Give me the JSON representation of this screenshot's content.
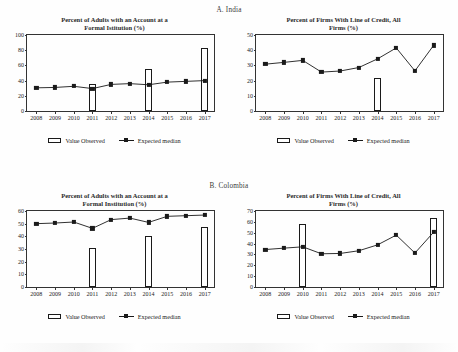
{
  "figure": {
    "panels": [
      {
        "header": "A. India",
        "charts": [
          {
            "title_line1": "Percent of Adults with an Account at a",
            "title_line2": "Formal Istitution (%)",
            "chart_data": {
              "type": "bar",
              "title": "Percent of Adults with an Account at a Formal Istitution (%)",
              "xlabel": "",
              "ylabel": "",
              "ylim": [
                0,
                100
              ],
              "yticks": [
                0,
                20,
                40,
                60,
                80,
                100
              ],
              "grid": false,
              "legend_position": "bottom",
              "categories": [
                "2008",
                "2009",
                "2010",
                "2011",
                "2012",
                "2013",
                "2014",
                "2015",
                "2016",
                "2017"
              ],
              "series": [
                {
                  "name": "Value Observed",
                  "type": "bar",
                  "values": [
                    null,
                    null,
                    null,
                    35.0,
                    null,
                    null,
                    55.0,
                    null,
                    null,
                    82.5
                  ]
                },
                {
                  "name": "Expected median",
                  "type": "line",
                  "values": [
                    30.5,
                    31.0,
                    32.5,
                    29.5,
                    35.0,
                    36.0,
                    34.5,
                    38.0,
                    39.0,
                    40.0
                  ]
                }
              ]
            },
            "legend": [
              {
                "label": "Value Observed",
                "marker": "open-rectangle-swatch"
              },
              {
                "label": "Expected median",
                "marker": "line-square-marker"
              }
            ]
          },
          {
            "title_line1": "Percent of Firms With Line of Credit, All",
            "title_line2": "Firms (%)",
            "chart_data": {
              "type": "bar",
              "title": "Percent of Firms With Line of Credit, All Firms (%)",
              "xlabel": "",
              "ylabel": "",
              "ylim": [
                0,
                50
              ],
              "yticks": [
                0,
                10,
                20,
                30,
                40,
                50
              ],
              "grid": false,
              "legend_position": "bottom",
              "categories": [
                "2008",
                "2009",
                "2010",
                "2011",
                "2012",
                "2013",
                "2014",
                "2015",
                "2016",
                "2017"
              ],
              "series": [
                {
                  "name": "Value Observed",
                  "type": "bar",
                  "values": [
                    null,
                    null,
                    null,
                    null,
                    null,
                    null,
                    21.8,
                    null,
                    null,
                    null
                  ]
                },
                {
                  "name": "Expected median",
                  "type": "line",
                  "values": [
                    30.8,
                    32.0,
                    33.3,
                    25.6,
                    26.3,
                    28.6,
                    34.3,
                    41.5,
                    26.4,
                    43.2
                  ]
                }
              ]
            },
            "legend": [
              {
                "label": "Value Observed",
                "marker": "open-rectangle-swatch"
              },
              {
                "label": "Expected median",
                "marker": "line-square-marker"
              }
            ]
          }
        ]
      },
      {
        "header": "B. Colombia",
        "charts": [
          {
            "title_line1": "Percent of Adults with an Account at a",
            "title_line2": "Formal Institution (%)",
            "chart_data": {
              "type": "bar",
              "title": "Percent of Adults with an Account at a Formal Institution (%)",
              "xlabel": "",
              "ylabel": "",
              "ylim": [
                0,
                60
              ],
              "yticks": [
                0,
                10,
                20,
                30,
                40,
                50,
                60
              ],
              "grid": false,
              "legend_position": "bottom",
              "categories": [
                "2008",
                "2009",
                "2010",
                "2011",
                "2012",
                "2013",
                "2014",
                "2015",
                "2016",
                "2017"
              ],
              "series": [
                {
                  "name": "Value Observed",
                  "type": "bar",
                  "values": [
                    null,
                    null,
                    null,
                    31.0,
                    null,
                    null,
                    40.2,
                    null,
                    null,
                    47.2
                  ]
                },
                {
                  "name": "Expected median",
                  "type": "line",
                  "values": [
                    50.0,
                    50.5,
                    51.3,
                    46.3,
                    53.2,
                    54.4,
                    51.0,
                    55.8,
                    56.3,
                    56.8
                  ]
                }
              ]
            },
            "legend": [
              {
                "label": "Value Observed",
                "marker": "open-rectangle-swatch"
              },
              {
                "label": "Expected median",
                "marker": "line-square-marker"
              }
            ]
          },
          {
            "title_line1": "Percent of Firms With Line of Credit, All",
            "title_line2": "Firms (%)",
            "chart_data": {
              "type": "bar",
              "title": "Percent of Firms With Line of Credit, All Firms (%)",
              "xlabel": "",
              "ylabel": "",
              "ylim": [
                0,
                70
              ],
              "yticks": [
                0,
                10,
                20,
                30,
                40,
                50,
                60,
                70
              ],
              "grid": false,
              "legend_position": "bottom",
              "categories": [
                "2008",
                "2009",
                "2010",
                "2011",
                "2012",
                "2013",
                "2014",
                "2015",
                "2016",
                "2017"
              ],
              "series": [
                {
                  "name": "Value Observed",
                  "type": "bar",
                  "values": [
                    null,
                    null,
                    58.0,
                    null,
                    null,
                    null,
                    null,
                    null,
                    null,
                    63.5
                  ]
                },
                {
                  "name": "Expected median",
                  "type": "line",
                  "values": [
                    34.5,
                    35.8,
                    37.0,
                    30.6,
                    30.9,
                    33.4,
                    38.8,
                    47.8,
                    31.3,
                    50.5
                  ]
                }
              ]
            },
            "legend": [
              {
                "label": "Value Observed",
                "marker": "open-rectangle-swatch"
              },
              {
                "label": "Expected median",
                "marker": "line-square-marker"
              }
            ]
          }
        ]
      }
    ],
    "colors": {
      "ink": "#1a1a1a",
      "axis": "#333333",
      "bar_fill": "#ffffff",
      "background": "#fefefe"
    }
  }
}
